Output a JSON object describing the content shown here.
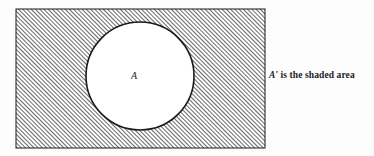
{
  "figure": {
    "background_color": "#fdfdfd",
    "universe_rect": {
      "x": 16,
      "y": 9,
      "width": 249,
      "height": 139,
      "border_color": "#1a1a1a",
      "border_width": 1,
      "fill": "diagonal-hatch",
      "hatch_angle_degrees": 45,
      "hatch_spacing_px": 3,
      "hatch_color": "#1f1f1f"
    },
    "set_circle": {
      "cx": 140,
      "cy": 76,
      "r": 54,
      "fill_color": "#ffffff",
      "stroke_color": "#1a1a1a",
      "stroke_width": 1.6
    },
    "set_label": {
      "text": "A",
      "x": 134,
      "y": 77,
      "style": "italic"
    },
    "caption": {
      "symbol": "A",
      "prime": "′",
      "text": " is the shaded area",
      "full_text": "A′ is the shaded area"
    }
  }
}
